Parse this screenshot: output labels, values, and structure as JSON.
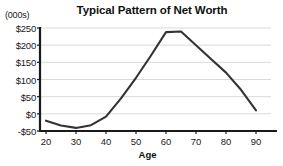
{
  "chart_data": {
    "type": "line",
    "title": "Typical Pattern of Net Worth",
    "units_note": "(000s)",
    "xlabel": "Age",
    "ylabel": "",
    "xlim": [
      18,
      95
    ],
    "ylim": [
      -50,
      250
    ],
    "xticks": [
      20,
      30,
      40,
      50,
      60,
      70,
      80,
      90
    ],
    "xtick_labels": [
      "20",
      "30",
      "40",
      "50",
      "60",
      "70",
      "80",
      "90"
    ],
    "yticks": [
      -50,
      0,
      50,
      100,
      150,
      200,
      250
    ],
    "ytick_labels": [
      "-$50",
      "$0",
      "$50",
      "$100",
      "$150",
      "$200",
      "$250"
    ],
    "grid": "horizontal",
    "legend": "none",
    "series": [
      {
        "name": "Net Worth",
        "color": "#333333",
        "x": [
          20,
          25,
          30,
          35,
          40,
          45,
          50,
          55,
          60,
          65,
          70,
          75,
          80,
          85,
          90
        ],
        "values": [
          -20,
          -34,
          -41,
          -33,
          -8,
          45,
          105,
          170,
          238,
          240,
          200,
          160,
          120,
          70,
          10
        ]
      }
    ]
  },
  "colors": {
    "line": "#333333",
    "axis": "#1a1a1a",
    "grid": "#d9d9d9",
    "background": "#ffffff",
    "text": "#111111"
  }
}
